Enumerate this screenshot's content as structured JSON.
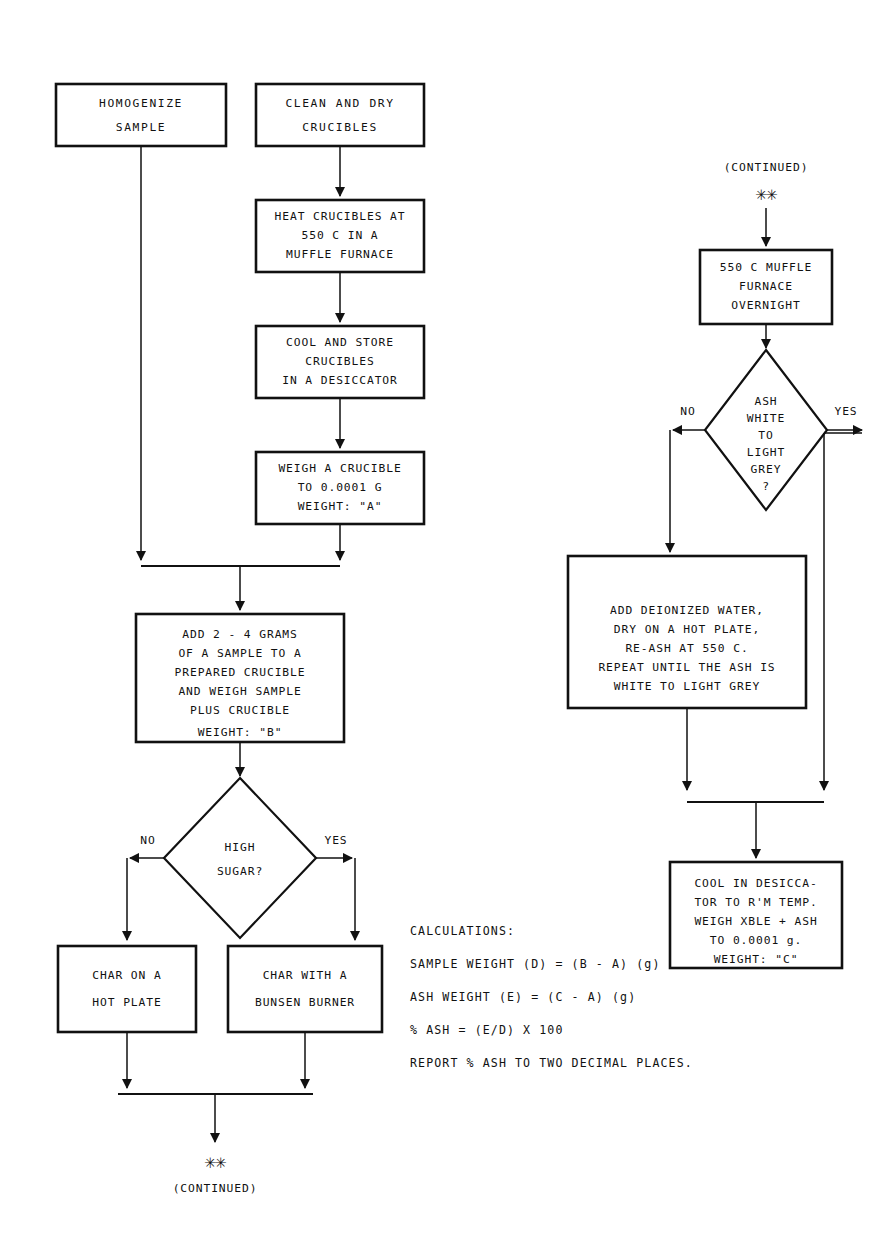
{
  "diagram": {
    "stroke_color": "#111111",
    "background_color": "#ffffff"
  },
  "nodes": {
    "homogenize_sample": {
      "shape": "process",
      "lines": [
        "HOMOGENIZE",
        "",
        "SAMPLE"
      ]
    },
    "clean_dry_crucibles": {
      "shape": "process",
      "lines": [
        "CLEAN AND DRY",
        "",
        "CRUCIBLES"
      ]
    },
    "heat_crucibles": {
      "shape": "process",
      "lines": [
        "HEAT CRUCIBLES AT",
        "550 C IN A",
        "MUFFLE FURNACE"
      ]
    },
    "cool_store_crucibles": {
      "shape": "process",
      "lines": [
        "COOL AND STORE",
        "CRUCIBLES",
        "IN A DESICCATOR"
      ]
    },
    "weigh_crucible": {
      "shape": "process",
      "lines": [
        "WEIGH A CRUCIBLE",
        "TO 0.0001 G",
        "WEIGHT:  \"A\""
      ]
    },
    "add_sample": {
      "shape": "process",
      "lines": [
        "ADD 2 - 4 GRAMS",
        "OF A SAMPLE TO A",
        "PREPARED CRUCIBLE",
        "AND WEIGH SAMPLE",
        "PLUS CRUCIBLE",
        "",
        "WEIGHT:  \"B\""
      ]
    },
    "high_sugar_decision": {
      "shape": "decision",
      "lines": [
        "HIGH",
        "SUGAR?"
      ],
      "no_label": "NO",
      "yes_label": "YES"
    },
    "char_hot_plate": {
      "shape": "process",
      "lines": [
        "CHAR ON A",
        "",
        "HOT PLATE"
      ]
    },
    "char_bunsen": {
      "shape": "process",
      "lines": [
        "CHAR WITH A",
        "",
        "BUNSEN BURNER"
      ]
    },
    "continued_bottom": {
      "shape": "connector",
      "marker": "✳✳",
      "label": "(CONTINUED)"
    },
    "continued_top": {
      "shape": "connector",
      "marker": "✳✳",
      "label": "(CONTINUED)"
    },
    "muffle_overnight": {
      "shape": "process",
      "lines": [
        "550 C MUFFLE",
        "FURNACE",
        "OVERNIGHT"
      ]
    },
    "ash_white_decision": {
      "shape": "decision",
      "lines": [
        "ASH",
        "WHITE",
        "TO",
        "LIGHT",
        "GREY",
        "?"
      ],
      "no_label": "NO",
      "yes_label": "YES"
    },
    "add_deionized_water": {
      "shape": "process",
      "lines": [
        "ADD DEIONIZED WATER,",
        "DRY ON A HOT PLATE,",
        "RE-ASH AT 550 C.",
        "REPEAT UNTIL THE ASH IS",
        "WHITE TO LIGHT GREY"
      ]
    },
    "cool_in_desiccator": {
      "shape": "process",
      "lines": [
        "COOL IN DESICCA-",
        "TOR TO R'M TEMP.",
        "WEIGH XBLE + ASH",
        "TO 0.0001 g.",
        "WEIGHT:  \"C\""
      ]
    }
  },
  "calculations": {
    "heading": "CALCULATIONS:",
    "lines": [
      "SAMPLE WEIGHT (D) = (B - A) (g)",
      "ASH WEIGHT (E) = (C - A) (g)",
      "% ASH = (E/D) X 100",
      "REPORT % ASH TO TWO DECIMAL PLACES."
    ]
  }
}
